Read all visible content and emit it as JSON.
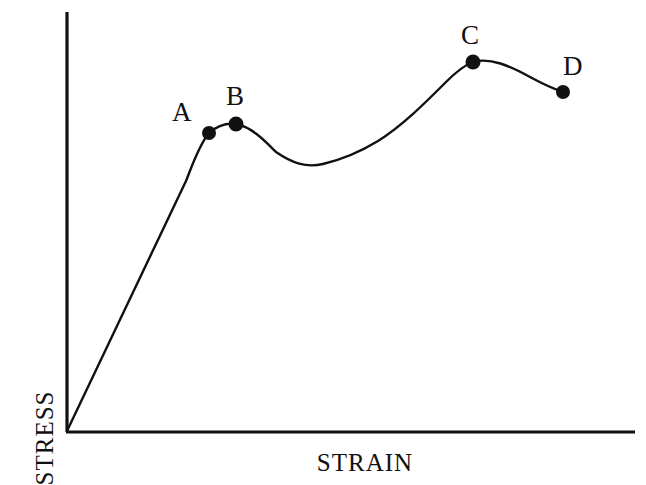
{
  "figure": {
    "kind": "stress-strain-curve",
    "background_color": "#ffffff",
    "ink_color": "#111111"
  },
  "axes": {
    "x_label": "STRAIN",
    "y_label": "STRESS",
    "x_axis_line": {
      "x1": 67,
      "y1": 432,
      "x2": 635,
      "y2": 432
    },
    "y_axis_line": {
      "x1": 67,
      "y1": 12,
      "x2": 67,
      "y2": 432
    },
    "ticks": [],
    "tick_labels": [],
    "grid": false
  },
  "points": [
    {
      "id": "A",
      "label": "A",
      "px": 209,
      "py": 133,
      "label_px": 172,
      "label_py": 99
    },
    {
      "id": "B",
      "label": "B",
      "px": 236,
      "py": 124,
      "label_px": 226,
      "label_py": 83
    },
    {
      "id": "C",
      "label": "C",
      "px": 473,
      "py": 62,
      "label_px": 461,
      "label_py": 22
    },
    {
      "id": "D",
      "label": "D",
      "px": 563,
      "py": 92,
      "label_px": 563,
      "label_py": 53
    }
  ],
  "chart_data": {
    "type": "line",
    "title": "",
    "subtitle": "",
    "xlabel": "STRAIN",
    "ylabel": "STRESS",
    "xlim": [
      0,
      1
    ],
    "ylim": [
      0,
      1
    ],
    "grid": false,
    "legend": null,
    "tick_labels": {
      "x": [],
      "y": []
    },
    "annotations": [
      {
        "text": "A",
        "x": 0.25,
        "y": 0.71,
        "note": "upper yield / proportional limit"
      },
      {
        "text": "B",
        "x": 0.3,
        "y": 0.73,
        "note": "local peak at end of yield plateau"
      },
      {
        "text": "C",
        "x": 0.71,
        "y": 0.88,
        "note": "ultimate tensile strength (maximum)"
      },
      {
        "text": "D",
        "x": 0.87,
        "y": 0.81,
        "note": "fracture point"
      }
    ],
    "series": [
      {
        "name": "stress-strain",
        "marked_points": [
          "A",
          "B",
          "C",
          "D"
        ],
        "x": [
          0.0,
          0.05,
          0.1,
          0.15,
          0.2,
          0.225,
          0.25,
          0.27,
          0.3,
          0.33,
          0.37,
          0.41,
          0.45,
          0.5,
          0.55,
          0.6,
          0.65,
          0.71,
          0.76,
          0.81,
          0.87
        ],
        "y": [
          0.0,
          0.142,
          0.284,
          0.426,
          0.568,
          0.645,
          0.711,
          0.724,
          0.733,
          0.722,
          0.68,
          0.648,
          0.638,
          0.664,
          0.714,
          0.772,
          0.832,
          0.881,
          0.866,
          0.838,
          0.809
        ]
      }
    ],
    "curve_path_px": "M 67 431 L 186 181 C 192 166 199 145 209 133 C 219 124 228 123 236 124 C 252 127 265 141 276 152 C 292 163 306 168 323 164 C 344 159 360 152 378 141 C 402 126 424 104 446 82 C 456 72 465 65 473 62 C 490 57 510 66 530 77 C 543 84 554 89 563 92"
  },
  "markers": {
    "radius_px": 7,
    "fill": "#111111",
    "style": "filled-circle"
  },
  "stroke": {
    "curve_width_px": 2.4,
    "axis_width_px": 3.2
  }
}
